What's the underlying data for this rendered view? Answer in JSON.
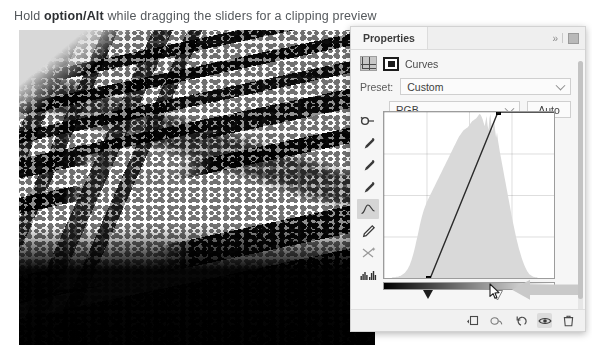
{
  "caption": {
    "prefix": "Hold ",
    "bold": "option/Alt",
    "suffix": " while dragging the sliders for a clipping preview"
  },
  "photo": {
    "alt_description": "High-contrast black and white clipped preview of a glacial mountain landscape"
  },
  "panel": {
    "tab_label": "Properties",
    "collapse_icon": "double-chevron-right-icon",
    "menu_icon": "panel-menu-icon",
    "adjustment": {
      "type_icon": "curves-adjustment-icon",
      "mask_icon": "layer-mask-icon",
      "label": "Curves"
    },
    "preset": {
      "label": "Preset:",
      "value": "Custom",
      "chevron_icon": "chevron-down-icon"
    },
    "channel": {
      "value": "RGB",
      "chevron_icon": "chevron-down-icon",
      "auto_label": "Auto"
    },
    "tools": [
      {
        "name": "targeted-adjustment-tool-icon",
        "active": false
      },
      {
        "name": "black-point-eyedropper-icon",
        "active": false
      },
      {
        "name": "gray-point-eyedropper-icon",
        "active": false
      },
      {
        "name": "white-point-eyedropper-icon",
        "active": false
      },
      {
        "name": "curve-point-tool-icon",
        "active": true
      },
      {
        "name": "pencil-draw-curve-icon",
        "active": false
      },
      {
        "name": "smooth-curve-icon",
        "active": false
      },
      {
        "name": "histogram-toggle-icon",
        "active": false
      }
    ],
    "values": {
      "input_label": "Input:",
      "input_value": "171",
      "output_label": "Output:",
      "output_value": "255"
    },
    "bottom_icons": [
      {
        "name": "clip-to-layer-icon",
        "selected": false
      },
      {
        "name": "view-previous-state-icon",
        "selected": false
      },
      {
        "name": "reset-adjustment-icon",
        "selected": false
      },
      {
        "name": "toggle-layer-visibility-icon",
        "selected": true
      },
      {
        "name": "delete-adjustment-layer-icon",
        "selected": false
      }
    ],
    "annotation": {
      "arrow_icon": "left-pointing-arrow-annotation",
      "cursor_icon": "mouse-pointer-icon"
    }
  },
  "chart_data": {
    "type": "line",
    "xlabel": "Input",
    "ylabel": "Output",
    "xlim": [
      0,
      255
    ],
    "ylim": [
      0,
      255
    ],
    "grid": true,
    "legend": null,
    "series": [
      {
        "name": "RGB curve",
        "points": [
          [
            67,
            0
          ],
          [
            171,
            255
          ]
        ]
      }
    ],
    "control_points": [
      {
        "input": 67,
        "output": 0,
        "role": "black-point"
      },
      {
        "input": 171,
        "output": 255,
        "role": "white-point-selected"
      }
    ],
    "sliders": {
      "black_point": 67,
      "white_point": 171
    },
    "histogram": {
      "bins": [
        0,
        0,
        0,
        0,
        0,
        0,
        0,
        0,
        0,
        1,
        1,
        1,
        1,
        2,
        2,
        2,
        3,
        3,
        4,
        5,
        6,
        7,
        8,
        10,
        12,
        14,
        17,
        20,
        24,
        28,
        33,
        38,
        44,
        50,
        57,
        63,
        70,
        77,
        84,
        90,
        96,
        101,
        106,
        110,
        114,
        118,
        121,
        124,
        127,
        130,
        133,
        136,
        139,
        142,
        145,
        148,
        151,
        154,
        157,
        160,
        163,
        166,
        169,
        172,
        175,
        178,
        181,
        184,
        187,
        190,
        193,
        196,
        199,
        202,
        205,
        208,
        211,
        214,
        217,
        220,
        222,
        224,
        226,
        228,
        230,
        231,
        232,
        233,
        234,
        236,
        238,
        240,
        242,
        244,
        245,
        246,
        247,
        248,
        250,
        252,
        254,
        255,
        253,
        250,
        246,
        241,
        236,
        244,
        252,
        238,
        230,
        248,
        255,
        240,
        228,
        236,
        244,
        230,
        218,
        226,
        214,
        205,
        196,
        188,
        180,
        172,
        164,
        156,
        148,
        140,
        132,
        124,
        116,
        108,
        100,
        92,
        85,
        78,
        71,
        64,
        58,
        52,
        46,
        41,
        36,
        31,
        27,
        23,
        19,
        16,
        13,
        10,
        8,
        6,
        5,
        4,
        3,
        2,
        2,
        1,
        1,
        1,
        0,
        0,
        0,
        0,
        0,
        0,
        0,
        0,
        0,
        0,
        0,
        0,
        0,
        0,
        0,
        0,
        0,
        0
      ],
      "range": [
        0,
        255
      ]
    }
  }
}
